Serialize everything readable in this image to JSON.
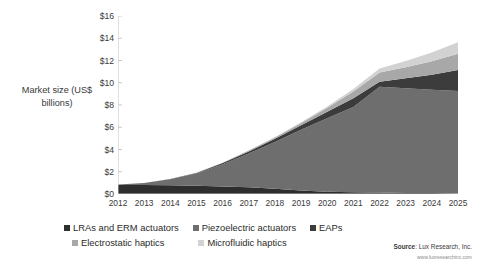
{
  "chart_data": {
    "type": "area",
    "stacked": true,
    "title": "",
    "xlabel": "",
    "ylabel": "Market size (US$ billions)",
    "ylim": [
      0,
      16
    ],
    "ytick_labels": [
      "$0",
      "$2",
      "$4",
      "$6",
      "$8",
      "$10",
      "$12",
      "$14",
      "$16"
    ],
    "ytick_values": [
      0,
      2,
      4,
      6,
      8,
      10,
      12,
      14,
      16
    ],
    "grid": false,
    "legend_position": "bottom",
    "categories": [
      "2012",
      "2013",
      "2014",
      "2015",
      "2016",
      "2017",
      "2018",
      "2019",
      "2020",
      "2021",
      "2022",
      "2023",
      "2024",
      "2025"
    ],
    "series": [
      {
        "name": "LRAs and ERM actuators",
        "color": "#2e2e2e",
        "values": [
          0.8,
          0.8,
          0.78,
          0.74,
          0.68,
          0.6,
          0.48,
          0.32,
          0.2,
          0.16,
          0.13,
          0.1,
          0.08,
          0.05
        ]
      },
      {
        "name": "Piezoelectric actuators",
        "color": "#6e6e6e",
        "values": [
          0.05,
          0.2,
          0.55,
          1.1,
          2.0,
          3.05,
          4.2,
          5.45,
          6.6,
          7.65,
          9.5,
          9.4,
          9.3,
          9.2
        ]
      },
      {
        "name": "EAPs",
        "color": "#3c3c3c",
        "values": [
          0.0,
          0.0,
          0.02,
          0.05,
          0.1,
          0.18,
          0.28,
          0.42,
          0.6,
          0.8,
          0.45,
          0.9,
          1.35,
          1.9
        ]
      },
      {
        "name": "Electrostatic haptics",
        "color": "#a8a8a8",
        "values": [
          0.0,
          0.0,
          0.0,
          0.01,
          0.03,
          0.07,
          0.12,
          0.2,
          0.35,
          0.6,
          0.85,
          1.0,
          1.2,
          1.45
        ]
      },
      {
        "name": "Microfluidic haptics",
        "color": "#d2d2d2",
        "values": [
          0.0,
          0.0,
          0.0,
          0.0,
          0.01,
          0.02,
          0.04,
          0.07,
          0.12,
          0.22,
          0.35,
          0.55,
          0.8,
          1.05
        ]
      }
    ],
    "totals": [
      0.85,
      1.0,
      1.35,
      1.9,
      2.82,
      3.92,
      5.12,
      6.46,
      7.87,
      9.43,
      11.28,
      11.95,
      12.73,
      13.65
    ]
  },
  "axis": {
    "y_title": "Market size (US$ billions)"
  },
  "legend": {
    "row1": [
      {
        "label": "LRAs and ERM actuators",
        "color": "#2e2e2e"
      },
      {
        "label": "Piezoelectric actuators",
        "color": "#6e6e6e"
      },
      {
        "label": "EAPs",
        "color": "#3c3c3c"
      }
    ],
    "row2": [
      {
        "label": "Electrostatic haptics",
        "color": "#a8a8a8"
      },
      {
        "label": "Microfluidic haptics",
        "color": "#d2d2d2"
      }
    ]
  },
  "source": {
    "label": "Source",
    "separator": ": ",
    "text": "Lux Research, Inc.",
    "url": "www.luxresearchinc.com"
  }
}
